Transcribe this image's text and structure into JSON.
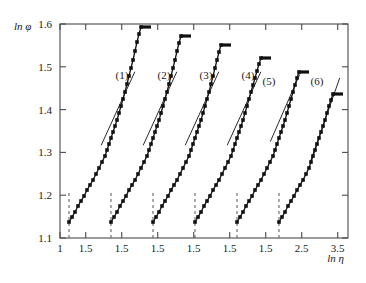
{
  "figure": {
    "background": "#ffffff",
    "frame_color": "#4a4a4a",
    "marker_color": "#111111",
    "line_color": "#111111",
    "dash_color": "#666666"
  },
  "axes": {
    "y_axis_label": "ln φ",
    "x_axis_label": "ln η",
    "y_ticks": [
      "1.1",
      "1.2",
      "1.3",
      "1.4",
      "1.5",
      "1.6"
    ],
    "y_min": 1.1,
    "y_max": 1.6,
    "x_ticks": [
      "1",
      "1.5",
      "1.5",
      "1.5",
      "1.5",
      "1.5",
      "1.5",
      "2.5",
      "3.5"
    ],
    "x_tick_positions": [
      0.0,
      0.0893,
      0.2143,
      0.3393,
      0.4643,
      0.5893,
      0.7143,
      0.8393,
      0.9643
    ]
  },
  "chart_data": {
    "type": "scatter",
    "title": "",
    "xlabel": "ln η",
    "ylabel": "ln φ",
    "ylim": [
      1.1,
      1.6
    ],
    "grid": false,
    "legend": "inline-curve-labels",
    "series": [
      {
        "name": "(1)",
        "label": "(1)",
        "label_x": 122,
        "label_y": 79,
        "dash_x": 69,
        "points": [
          [
            69,
            222
          ],
          [
            72,
            217
          ],
          [
            75,
            212
          ],
          [
            78,
            206
          ],
          [
            81,
            201
          ],
          [
            84,
            196
          ],
          [
            87,
            190
          ],
          [
            90,
            185
          ],
          [
            93,
            180
          ],
          [
            96,
            174
          ],
          [
            99,
            168
          ],
          [
            102,
            162
          ],
          [
            105,
            156
          ],
          [
            107,
            150
          ],
          [
            109,
            144
          ],
          [
            111,
            138
          ],
          [
            113,
            132
          ],
          [
            115,
            126
          ],
          [
            117,
            120
          ],
          [
            119,
            113
          ],
          [
            121,
            106
          ],
          [
            123,
            99
          ],
          [
            125,
            92
          ],
          [
            127,
            84
          ],
          [
            129,
            76
          ],
          [
            131,
            68
          ],
          [
            133,
            60
          ],
          [
            135,
            51
          ],
          [
            137,
            42
          ],
          [
            139,
            34
          ],
          [
            141,
            27
          ]
        ],
        "tangent": [
          [
            110,
            126
          ],
          [
            126,
            91
          ]
        ],
        "cap": [
          [
            141,
            27
          ],
          [
            151,
            27
          ]
        ]
      },
      {
        "name": "(2)",
        "label": "(2)",
        "label_x": 164,
        "label_y": 79,
        "dash_x": 111,
        "points": [
          [
            111,
            222
          ],
          [
            114,
            217
          ],
          [
            117,
            212
          ],
          [
            120,
            206
          ],
          [
            123,
            201
          ],
          [
            126,
            196
          ],
          [
            129,
            190
          ],
          [
            132,
            185
          ],
          [
            135,
            180
          ],
          [
            138,
            174
          ],
          [
            141,
            168
          ],
          [
            144,
            162
          ],
          [
            147,
            156
          ],
          [
            149,
            150
          ],
          [
            151,
            144
          ],
          [
            153,
            138
          ],
          [
            155,
            132
          ],
          [
            157,
            126
          ],
          [
            159,
            120
          ],
          [
            161,
            113
          ],
          [
            163,
            106
          ],
          [
            165,
            99
          ],
          [
            167,
            92
          ],
          [
            169,
            84
          ],
          [
            171,
            76
          ],
          [
            173,
            68
          ],
          [
            175,
            60
          ],
          [
            177,
            51
          ],
          [
            179,
            43
          ],
          [
            181,
            36
          ]
        ],
        "tangent": [
          [
            152,
            126
          ],
          [
            168,
            91
          ]
        ],
        "cap": [
          [
            181,
            36
          ],
          [
            191,
            36
          ]
        ]
      },
      {
        "name": "(3)",
        "label": "(3)",
        "label_x": 206,
        "label_y": 79,
        "dash_x": 153,
        "points": [
          [
            153,
            222
          ],
          [
            156,
            217
          ],
          [
            159,
            212
          ],
          [
            162,
            206
          ],
          [
            165,
            201
          ],
          [
            168,
            196
          ],
          [
            171,
            190
          ],
          [
            174,
            185
          ],
          [
            177,
            180
          ],
          [
            180,
            174
          ],
          [
            183,
            168
          ],
          [
            186,
            162
          ],
          [
            189,
            156
          ],
          [
            191,
            150
          ],
          [
            193,
            144
          ],
          [
            195,
            138
          ],
          [
            197,
            132
          ],
          [
            199,
            126
          ],
          [
            201,
            120
          ],
          [
            203,
            113
          ],
          [
            205,
            106
          ],
          [
            207,
            99
          ],
          [
            209,
            92
          ],
          [
            211,
            84
          ],
          [
            213,
            76
          ],
          [
            215,
            68
          ],
          [
            217,
            60
          ],
          [
            219,
            52
          ],
          [
            221,
            45
          ]
        ],
        "tangent": [
          [
            194,
            126
          ],
          [
            210,
            91
          ]
        ],
        "cap": [
          [
            221,
            45
          ],
          [
            231,
            45
          ]
        ]
      },
      {
        "name": "(4)",
        "label": "(4)",
        "label_x": 248,
        "label_y": 79,
        "dash_x": 195,
        "points": [
          [
            195,
            222
          ],
          [
            198,
            217
          ],
          [
            201,
            212
          ],
          [
            204,
            206
          ],
          [
            207,
            201
          ],
          [
            210,
            196
          ],
          [
            213,
            190
          ],
          [
            216,
            185
          ],
          [
            219,
            180
          ],
          [
            222,
            174
          ],
          [
            225,
            168
          ],
          [
            228,
            162
          ],
          [
            231,
            156
          ],
          [
            233,
            150
          ],
          [
            235,
            144
          ],
          [
            237,
            138
          ],
          [
            239,
            132
          ],
          [
            241,
            126
          ],
          [
            243,
            120
          ],
          [
            245,
            113
          ],
          [
            247,
            106
          ],
          [
            249,
            99
          ],
          [
            251,
            92
          ],
          [
            253,
            85
          ],
          [
            255,
            78
          ],
          [
            257,
            71
          ],
          [
            259,
            64
          ],
          [
            261,
            58
          ]
        ],
        "tangent": [
          [
            236,
            126
          ],
          [
            252,
            91
          ]
        ],
        "cap": [
          [
            261,
            58
          ],
          [
            271,
            58
          ]
        ]
      },
      {
        "name": "(5)",
        "label": "(5)",
        "label_x": 269,
        "label_y": 85,
        "dash_x": 237,
        "points": [
          [
            237,
            222
          ],
          [
            240,
            217
          ],
          [
            243,
            212
          ],
          [
            246,
            206
          ],
          [
            249,
            201
          ],
          [
            252,
            196
          ],
          [
            255,
            190
          ],
          [
            258,
            185
          ],
          [
            261,
            180
          ],
          [
            264,
            174
          ],
          [
            267,
            168
          ],
          [
            270,
            162
          ],
          [
            273,
            156
          ],
          [
            275,
            150
          ],
          [
            277,
            144
          ],
          [
            279,
            138
          ],
          [
            281,
            132
          ],
          [
            283,
            126
          ],
          [
            285,
            120
          ],
          [
            287,
            113
          ],
          [
            289,
            106
          ],
          [
            291,
            99
          ],
          [
            293,
            92
          ],
          [
            295,
            85
          ],
          [
            297,
            78
          ],
          [
            299,
            72
          ]
        ],
        "tangent": [
          [
            278,
            124
          ],
          [
            292,
            92
          ]
        ],
        "cap": [
          [
            299,
            72
          ],
          [
            309,
            72
          ]
        ]
      },
      {
        "name": "(6)",
        "label": "(6)",
        "label_x": 317,
        "label_y": 85,
        "dash_x": 279,
        "points": [
          [
            279,
            222
          ],
          [
            282,
            217
          ],
          [
            285,
            212
          ],
          [
            288,
            206
          ],
          [
            291,
            201
          ],
          [
            294,
            196
          ],
          [
            297,
            190
          ],
          [
            300,
            185
          ],
          [
            303,
            180
          ],
          [
            306,
            174
          ],
          [
            309,
            168
          ],
          [
            311,
            162
          ],
          [
            313,
            156
          ],
          [
            315,
            150
          ],
          [
            317,
            144
          ],
          [
            319,
            138
          ],
          [
            321,
            132
          ],
          [
            323,
            126
          ],
          [
            325,
            120
          ],
          [
            327,
            113
          ],
          [
            329,
            106
          ],
          [
            331,
            100
          ],
          [
            333,
            94
          ]
        ],
        "tangent": [
          [
            318,
            140
          ],
          [
            332,
            100
          ]
        ],
        "cap": [
          [
            333,
            94
          ],
          [
            343,
            94
          ]
        ]
      }
    ]
  }
}
